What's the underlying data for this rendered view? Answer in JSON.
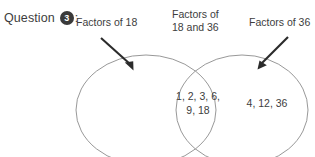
{
  "question": {
    "word": "Question",
    "number": "3",
    "colon": ":"
  },
  "diagram": {
    "type": "venn-two-set",
    "labels": {
      "left": "Factors of 18",
      "middle_line1": "Factors of",
      "middle_line2": "18 and 36",
      "right": "Factors of 36"
    },
    "regions": {
      "left_only": "",
      "intersection_line1": "1, 2, 3, 6,",
      "intersection_line2": "9, 18",
      "right_only": "4, 12, 36"
    },
    "sets": {
      "left_set_name": "Factors of 18",
      "right_set_name": "Factors of 36",
      "intersection_members": [
        1,
        2,
        3,
        6,
        9,
        18
      ],
      "right_only_members": [
        4,
        12,
        36
      ],
      "left_only_members": []
    },
    "colors": {
      "ellipse_stroke": "#8c8c8c",
      "arrow": "#2b2b2b",
      "text": "#3d3d3d",
      "badge_fill": "#3a3a3a",
      "badge_text": "#ffffff",
      "background": "#ffffff"
    }
  }
}
